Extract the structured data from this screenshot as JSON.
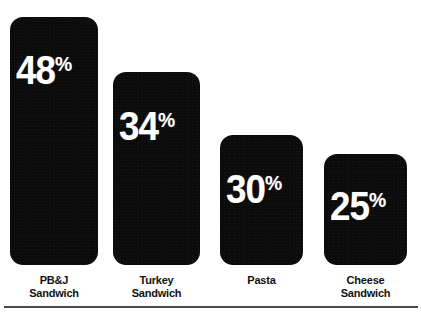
{
  "chart_data": {
    "type": "bar",
    "title": "",
    "subtitle": "",
    "xlabel": "",
    "ylabel": "",
    "grid": false,
    "legend": false,
    "legend_position": "none",
    "value_suffix": "%",
    "ylim": [
      0,
      50
    ],
    "categories": [
      "PB&J Sandwich",
      "Turkey Sandwich",
      "Pasta",
      "Cheese Sandwich"
    ],
    "values": [
      48,
      34,
      30,
      25
    ],
    "value_labels": [
      "48%",
      "34%",
      "30%",
      "25%"
    ],
    "bars": [
      {
        "category": "PB&J Sandwich",
        "category_line1": "PB&J",
        "category_line2": "Sandwich",
        "value": 48,
        "value_number": "48",
        "value_suffix": "%",
        "value_label": "48%",
        "left": 10,
        "width": 88,
        "top": 15,
        "height": 248,
        "label_bottom": 178
      },
      {
        "category": "Turkey Sandwich",
        "category_line1": "Turkey",
        "category_line2": "Sandwich",
        "value": 34,
        "value_number": "34",
        "value_suffix": "%",
        "value_label": "34%",
        "left": 113,
        "width": 87,
        "top": 70,
        "height": 193,
        "label_bottom": 122
      },
      {
        "category": "Pasta",
        "category_line1": "Pasta",
        "category_line2": "",
        "value": 30,
        "value_number": "30",
        "value_suffix": "%",
        "value_label": "30%",
        "left": 220,
        "width": 83,
        "top": 133,
        "height": 130,
        "label_bottom": 59
      },
      {
        "category": "Cheese Sandwich",
        "category_line1": "Cheese",
        "category_line2": "Sandwich",
        "value": 25,
        "value_number": "25",
        "value_suffix": "%",
        "value_label": "25%",
        "left": 324,
        "width": 83,
        "top": 152,
        "height": 111,
        "label_bottom": 42
      }
    ]
  },
  "style": {
    "bar_color": "#0b0b0b",
    "value_text_color": "#ffffff",
    "category_text_color": "#111111",
    "background_color": "#ffffff",
    "rule_color": "#4a4a4a"
  }
}
